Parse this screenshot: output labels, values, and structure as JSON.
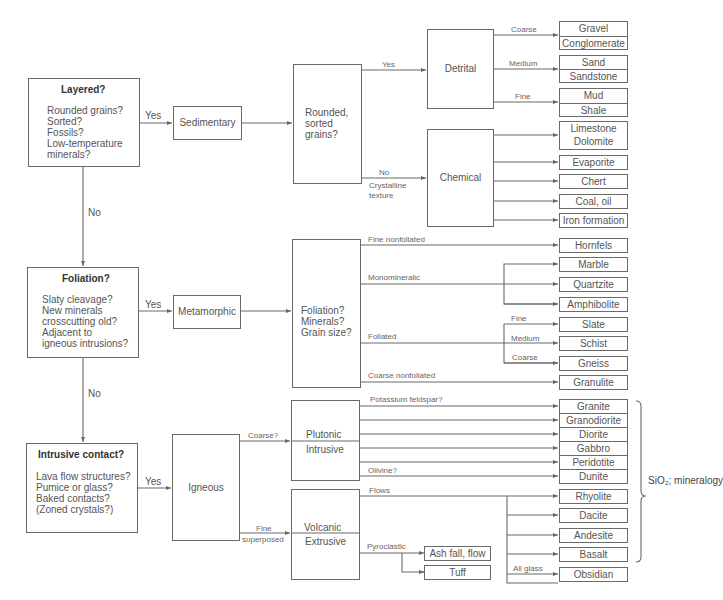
{
  "diagram": {
    "tests": {
      "layered": {
        "title": "Layered?",
        "lines": [
          "Rounded grains?",
          "Sorted?",
          "Fossils?",
          "Low-temperature",
          "minerals?"
        ]
      },
      "foliation": {
        "title": "Foliation?",
        "lines": [
          "Slaty cleavage?",
          "New minerals",
          "crosscutting old?",
          "Adjacent to",
          "igneous intrusions?"
        ]
      },
      "intrusive": {
        "title": "Intrusive contact?",
        "lines": [
          "Lava flow structures?",
          "Pumice or glass?",
          "Baked contacts?",
          "(Zoned crystals?)"
        ]
      }
    },
    "flow_labels": {
      "yes": "Yes",
      "no": "No"
    },
    "rock_classes": {
      "sedimentary": "Sedimentary",
      "metamorphic": "Metamorphic",
      "igneous": "Igneous"
    },
    "sedimentary": {
      "question": [
        "Rounded,",
        "sorted",
        "grains?"
      ],
      "yes_label": "Yes",
      "no_label": "No",
      "no_sublabel": [
        "Crystalline",
        "texture"
      ],
      "detrital": {
        "label": "Detrital",
        "branches": [
          {
            "label": "Coarse",
            "rocks": [
              "Gravel",
              "Conglomerate"
            ]
          },
          {
            "label": "Medium",
            "rocks": [
              "Sand",
              "Sandstone"
            ]
          },
          {
            "label": "Fine",
            "rocks": [
              "Mud",
              "Shale"
            ]
          }
        ]
      },
      "chemical": {
        "label": "Chemical",
        "rocks": [
          [
            "Limestone",
            "Dolomite"
          ],
          [
            "Evaporite"
          ],
          [
            "Chert"
          ],
          [
            "Coal, oil"
          ],
          [
            "Iron formation"
          ]
        ]
      }
    },
    "metamorphic": {
      "question": [
        "Foliation?",
        "Minerals?",
        "Grain size?"
      ],
      "branches": {
        "fine_nonfoliated": {
          "label": "Fine nonfoliated",
          "rock": "Hornfels"
        },
        "monomineralic": {
          "label": "Monomineralic",
          "rocks": [
            "Marble",
            "Quartzite",
            "Amphibolite"
          ]
        },
        "foliated": {
          "label": "Foliated",
          "sub": [
            {
              "label": "Fine",
              "rock": "Slate"
            },
            {
              "label": "Medium",
              "rock": "Schist"
            },
            {
              "label": "Coarse",
              "rock": "Gneiss"
            }
          ]
        },
        "coarse_nonfoliated": {
          "label": "Coarse nonfoliated",
          "rock": "Granulite"
        }
      }
    },
    "igneous": {
      "coarse_label": "Coarse?",
      "fine_label": "Fine",
      "fine_sublabel": "superposed",
      "plutonic": {
        "label1": "Plutonic",
        "label2": "Intrusive",
        "potassium_label": "Potassium feldspar?",
        "olivine_label": "Olivine?",
        "rocks": [
          "Granite",
          "Granodiorite",
          "Diorite",
          "Gabbro",
          "Peridotite",
          "Dunite"
        ]
      },
      "volcanic": {
        "label1": "Volcanic",
        "label2": "Extrusive",
        "flows_label": "Flows",
        "pyroclastic_label": "Pyroclastic",
        "all_glass_label": "All glass",
        "rocks": [
          "Rhyolite",
          "Dacite",
          "Andesite",
          "Basalt"
        ],
        "glass_rock": "Obsidian",
        "pyroclastic_rocks": [
          "Ash fall, flow",
          "Tuff"
        ]
      },
      "bracket_label": "SiO₂; mineralogy"
    }
  }
}
